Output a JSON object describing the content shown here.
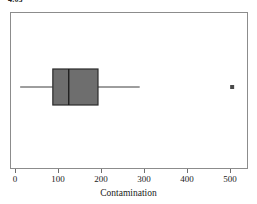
{
  "caption": {
    "text": "4.03"
  },
  "chart_data": {
    "type": "box",
    "title": "",
    "xlabel": "Contamination",
    "ylabel": "",
    "xlim": [
      -20,
      535
    ],
    "xticks": [
      0,
      100,
      200,
      300,
      400,
      500
    ],
    "xticklabels": [
      "0",
      "100",
      "200",
      "300",
      "400",
      "500"
    ],
    "grid": false,
    "legend": null,
    "orientation": "horizontal",
    "boxes": [
      {
        "name": "Contamination",
        "whisker_low": 12,
        "q1": 88,
        "median": 125,
        "q3": 193,
        "whisker_high": 290,
        "outliers": [
          505
        ]
      }
    ],
    "style": {
      "box_fill": "#6e6e6e",
      "box_edge": "#2b2b2b",
      "median_color": "#1a1a1a",
      "whisker_color": "#3d3d3d",
      "outlier_color": "#4a4a4a",
      "frame_color": "#8c8c8c",
      "background": "#ffffff"
    }
  }
}
